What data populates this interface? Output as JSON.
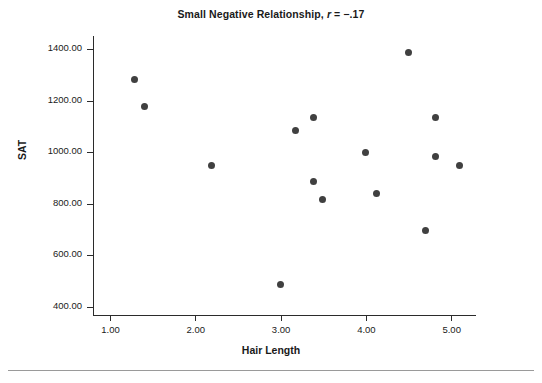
{
  "chart_data": {
    "type": "scatter",
    "title": "Small Negative Relationship, r = −.17",
    "title_prefix": "Small Negative Relationship, ",
    "title_stat_symbol": "r",
    "title_stat_value": " = −.17",
    "xlabel": "Hair Length",
    "ylabel": "SAT",
    "xlim": [
      0.72,
      5.72
    ],
    "ylim": [
      352,
      1440
    ],
    "grid": false,
    "legend": null,
    "marker_color": "#404040",
    "marker_size_px": 7,
    "xticks": [
      1.0,
      2.0,
      3.0,
      4.0,
      5.0
    ],
    "xtick_labels": [
      "1.00",
      "2.00",
      "3.00",
      "4.00",
      "5.00"
    ],
    "yticks": [
      400,
      600,
      800,
      1000,
      1200,
      1400
    ],
    "ytick_labels": [
      "400.00",
      "600.00",
      "800.00",
      "1000.00",
      "1200.00",
      "1400.00"
    ],
    "points": [
      {
        "x": 1.29,
        "y": 1281
      },
      {
        "x": 1.4,
        "y": 1177
      },
      {
        "x": 2.19,
        "y": 947
      },
      {
        "x": 3.0,
        "y": 487
      },
      {
        "x": 3.18,
        "y": 1086
      },
      {
        "x": 3.38,
        "y": 1136
      },
      {
        "x": 3.38,
        "y": 885
      },
      {
        "x": 3.49,
        "y": 816
      },
      {
        "x": 4.0,
        "y": 997
      },
      {
        "x": 4.13,
        "y": 838
      },
      {
        "x": 4.5,
        "y": 1385
      },
      {
        "x": 4.7,
        "y": 697
      },
      {
        "x": 4.82,
        "y": 1136
      },
      {
        "x": 4.82,
        "y": 985
      },
      {
        "x": 5.1,
        "y": 947
      }
    ]
  }
}
